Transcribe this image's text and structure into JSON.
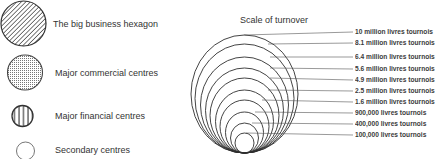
{
  "legend": {
    "items": [
      {
        "label": "The big business hexagon",
        "icon": "diagonal-hatched-circle"
      },
      {
        "label": "Major commercial centres",
        "icon": "dotted-circle"
      },
      {
        "label": "Major financial centres",
        "icon": "vertical-striped-circle"
      },
      {
        "label": "Secondary centres",
        "icon": "empty-circle"
      }
    ]
  },
  "scale": {
    "title": "Scale of turnover",
    "levels": [
      {
        "label": "10 million livres tournois",
        "value": 10000000
      },
      {
        "label": "8.1 million livres tournois",
        "value": 8100000
      },
      {
        "label": "6.4 million livres tournois",
        "value": 6400000
      },
      {
        "label": "5.6 million livres tournois",
        "value": 5600000
      },
      {
        "label": "4.9 million livres tournois",
        "value": 4900000
      },
      {
        "label": "2.5 million livres tournois",
        "value": 2500000
      },
      {
        "label": "1.6 million livres tournois",
        "value": 1600000
      },
      {
        "label": "900,000 livres tournois",
        "value": 900000
      },
      {
        "label": "400,000 livres tournois",
        "value": 400000
      },
      {
        "label": "100,000 livres tournois",
        "value": 100000
      }
    ]
  },
  "colors": {
    "ink": "#2a2a2a",
    "background": "#ffffff"
  }
}
